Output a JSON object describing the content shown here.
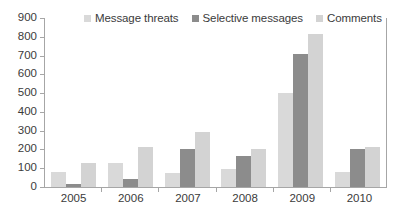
{
  "chart_data": {
    "type": "bar",
    "title": "",
    "subtitle": "",
    "xlabel": "",
    "ylabel": "",
    "categories": [
      "2005",
      "2006",
      "2007",
      "2008",
      "2009",
      "2010"
    ],
    "series": [
      {
        "name": "Message threats",
        "color": "#d9d9d9",
        "values": [
          80,
          130,
          75,
          95,
          500,
          80
        ]
      },
      {
        "name": "Selective messages",
        "color": "#8c8c8c",
        "values": [
          15,
          45,
          205,
          165,
          710,
          200
        ]
      },
      {
        "name": "Comments",
        "color": "#d3d3d3",
        "values": [
          130,
          215,
          295,
          200,
          815,
          215
        ]
      }
    ],
    "ylim": [
      0,
      900
    ],
    "ytick_step": 100,
    "yticks": [
      "0",
      "100",
      "200",
      "300",
      "400",
      "500",
      "600",
      "700",
      "800",
      "900"
    ],
    "grid": false,
    "legend_position": "top"
  },
  "legend": {
    "items": [
      {
        "label": "Message threats"
      },
      {
        "label": "Selective messages"
      },
      {
        "label": "Comments"
      }
    ]
  },
  "colors": {
    "axis": "#a6a6a6",
    "text": "#3b3b3b",
    "background": "#ffffff"
  }
}
